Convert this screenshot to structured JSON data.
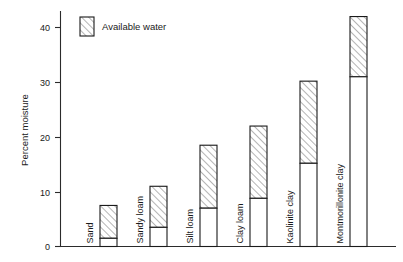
{
  "chart_data": {
    "type": "bar",
    "title": "",
    "subtitle": "",
    "xlabel": "",
    "ylabel": "Percent moisture",
    "ylim": [
      0,
      44
    ],
    "yticks": [
      0,
      10,
      20,
      30,
      40
    ],
    "ytick_labels": [
      "0",
      "10",
      "20",
      "30",
      "40"
    ],
    "grid": false,
    "stacked": true,
    "legend_position": "top-left",
    "legend": [
      "Available water"
    ],
    "categories": [
      "Sand",
      "Sandy loam",
      "Silt loam",
      "Clay loam",
      "Kaolinite clay",
      "Montmorillonite clay"
    ],
    "series": [
      {
        "name": "Unavailable water",
        "pattern": "solid-white",
        "values": [
          1.5,
          3.5,
          7.0,
          8.8,
          15.2,
          31.0
        ]
      },
      {
        "name": "Available water",
        "pattern": "diagonal-hatch",
        "values": [
          6.0,
          7.5,
          11.5,
          13.2,
          15.0,
          11.0
        ]
      }
    ],
    "totals": [
      7.5,
      11.0,
      18.5,
      22.0,
      30.2,
      42.0
    ]
  },
  "legend": {
    "label": "Available water",
    "swatch_name": "hatched-swatch"
  },
  "axes": {
    "y_title": "Percent moisture",
    "tick_labels": [
      "40",
      "30",
      "20",
      "10",
      "0"
    ]
  },
  "colors": {
    "ink": "#1a1a1a",
    "axis": "#2b2b2b",
    "bar_fill": "#ffffff",
    "hatch": "#2b2b2b",
    "background": "#ffffff"
  }
}
